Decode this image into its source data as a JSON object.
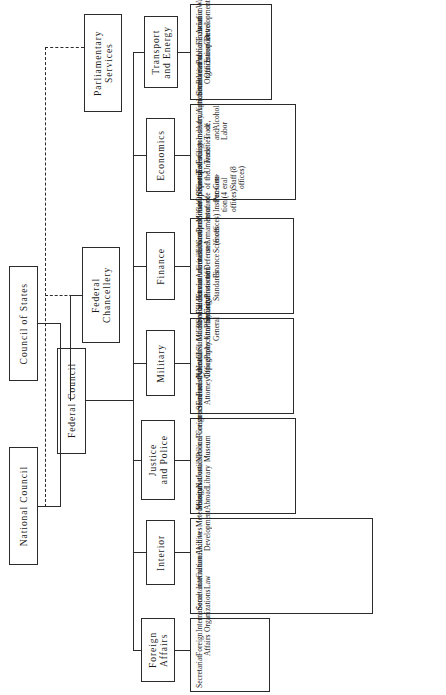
{
  "diagram": {
    "orientation": "rotated-90-ccw",
    "line_color": "#2b2b2b",
    "background": "#ffffff"
  },
  "parliament": {
    "council_of_states": "Council of States",
    "national_council": "National Council"
  },
  "executive": {
    "federal_council": "Federal Council",
    "federal_chancellery": "Federal Chancellery",
    "parliamentary_services": "Parliamentary Services"
  },
  "departments": [
    {
      "name": "Foreign Affairs",
      "offices": [
        "Secretariat",
        "Foreign Affairs",
        "International\nOrganizations",
        "International Law",
        "Aid to Development",
        "Missions Abroad"
      ]
    },
    {
      "name": "Interior",
      "offices": [
        "Secretariat",
        "Culture",
        "Archives",
        "Meteorology",
        "National Library",
        "National Museum",
        "Construction",
        "Forestry",
        "Health",
        "Statistics",
        "Social Security",
        "Environmental\nProtection",
        "Education and\nSciences",
        "Military Insurance",
        "Sports",
        "Federal\nUniversities"
      ]
    },
    {
      "name": "Justice\nand Police",
      "offices": [
        "Secretariat",
        "Justice",
        "Police",
        "Foreigners",
        "Federal Attorney",
        "Patent Office",
        "Civil Protection",
        "Physical Planning",
        "Bureau of\nStandards"
      ]
    },
    {
      "name": "Military",
      "offices": [
        "Secretariat",
        "National\nTopography",
        "Military Attorney\nGeneral",
        "Field Commissioner",
        "General Defense",
        "Group of Armament\n(6 offices)",
        "Group of Instruc-\ntion (4 offices)",
        "Group of the Gen-\neral Staff (8\noffices)"
      ]
    },
    {
      "name": "Finance",
      "offices": [
        "Secretariat",
        "Administration of\nFinance",
        "Personnel",
        "Office of Pensions",
        "Taxes",
        "Customs",
        "Administration of\nAlcohol",
        "Bureau of\nOrganization",
        "Financial Control"
      ]
    },
    {
      "name": "Economics",
      "offices": [
        "Secretariat",
        "Foreign Trade",
        "Industry, Trade,\nand Labor",
        "Agriculture",
        "Veterinarian\nOffice",
        "Economic\nDevelopment",
        "National Economic\nSupply",
        "Housing",
        "Administration of\nGrain"
      ]
    },
    {
      "name": "Transport\nand Energy",
      "offices": [
        "Secretariat",
        "Public Transport",
        "Aviation",
        "Water",
        "Energy",
        "Road Construction",
        "Post, Telephone,\nand Telegraph",
        "Railways"
      ]
    }
  ]
}
